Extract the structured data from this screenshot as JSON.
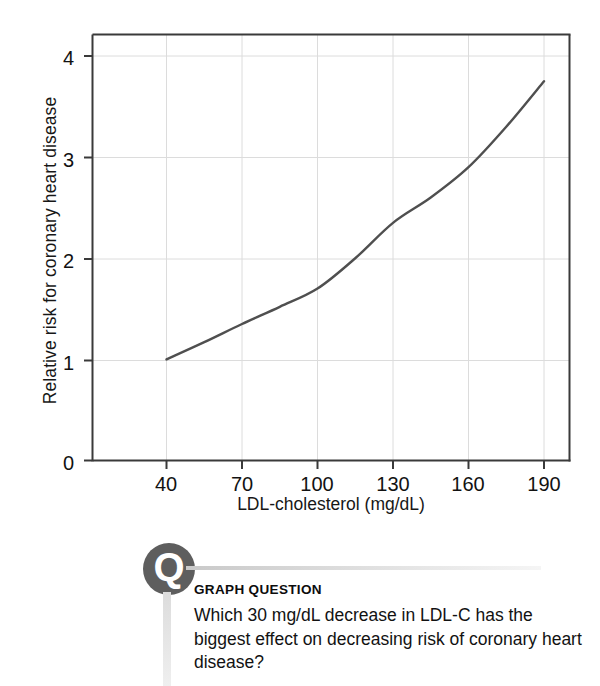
{
  "chart_data": {
    "type": "line",
    "title": "",
    "subtitle": "",
    "xlabel": "LDL-cholesterol (mg/dL)",
    "ylabel": "Relative risk for coronary heart disease",
    "xlim": [
      25,
      200
    ],
    "ylim": [
      0,
      4.2
    ],
    "xticks": [
      40,
      70,
      100,
      130,
      160,
      190
    ],
    "yticks": [
      0,
      1,
      2,
      3,
      4
    ],
    "xtick_labels": [
      "40",
      "70",
      "100",
      "130",
      "160",
      "190"
    ],
    "ytick_labels": [
      "0",
      "1",
      "2",
      "3",
      "4"
    ],
    "grid": true,
    "grid_color": "#dcdcdc",
    "legend": null,
    "series": [
      {
        "name": "Relative risk for coronary heart disease",
        "color": "#4f4f4f",
        "line_width": 2.4,
        "x": [
          40,
          55,
          70,
          85,
          100,
          115,
          130,
          145,
          160,
          175,
          190
        ],
        "values": [
          1.0,
          1.17,
          1.35,
          1.52,
          1.7,
          2.0,
          2.35,
          2.6,
          2.9,
          3.3,
          3.75
        ]
      }
    ],
    "annotations": []
  },
  "figure": {
    "axis_color": "#3a3a3a",
    "background": "#ffffff"
  },
  "callout": {
    "badge_letter": "Q",
    "badge_color": "#5e5e5e",
    "heading": "GRAPH QUESTION",
    "question": "Which 30 mg/dL decrease in LDL-C has the biggest effect on decreasing risk of coronary heart disease?"
  }
}
